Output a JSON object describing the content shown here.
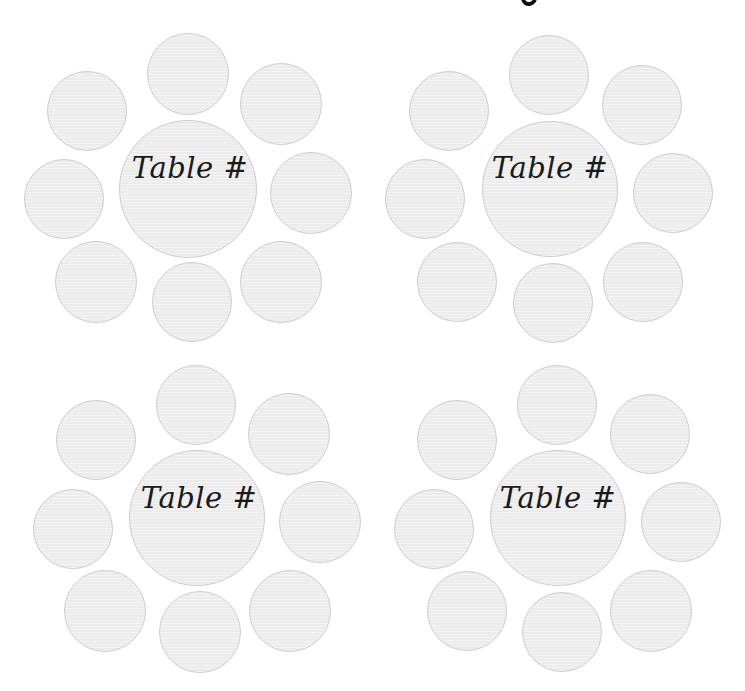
{
  "page": {
    "width": 745,
    "height": 691,
    "background": "#ffffff"
  },
  "title": {
    "visible_fragment": "g",
    "note_visible": "only the bottom tail of a descender glyph is visible at top edge"
  },
  "style": {
    "seat_fill": "#eeeeee",
    "seat_border": "#cdcdcd",
    "label_color": "#1a1a1a"
  },
  "tables": [
    {
      "label": "Table #",
      "center": {
        "x": 188,
        "y": 189,
        "r": 69
      },
      "label_pos": {
        "x": 190,
        "y": 168
      },
      "seats": [
        {
          "x": 188,
          "y": 74,
          "r": 41
        },
        {
          "x": 281,
          "y": 104,
          "r": 41
        },
        {
          "x": 311,
          "y": 193,
          "r": 41
        },
        {
          "x": 281,
          "y": 282,
          "r": 41
        },
        {
          "x": 192,
          "y": 302,
          "r": 40
        },
        {
          "x": 96,
          "y": 282,
          "r": 41
        },
        {
          "x": 64,
          "y": 199,
          "r": 40
        },
        {
          "x": 87,
          "y": 111,
          "r": 40
        }
      ]
    },
    {
      "label": "Table #",
      "center": {
        "x": 550,
        "y": 189,
        "r": 68
      },
      "label_pos": {
        "x": 550,
        "y": 168
      },
      "seats": [
        {
          "x": 549,
          "y": 75,
          "r": 40
        },
        {
          "x": 642,
          "y": 105,
          "r": 40
        },
        {
          "x": 673,
          "y": 193,
          "r": 40
        },
        {
          "x": 643,
          "y": 282,
          "r": 40
        },
        {
          "x": 553,
          "y": 303,
          "r": 40
        },
        {
          "x": 457,
          "y": 282,
          "r": 40
        },
        {
          "x": 425,
          "y": 199,
          "r": 40
        },
        {
          "x": 449,
          "y": 111,
          "r": 40
        }
      ]
    },
    {
      "label": "Table #",
      "center": {
        "x": 197,
        "y": 518,
        "r": 68
      },
      "label_pos": {
        "x": 199,
        "y": 498
      },
      "seats": [
        {
          "x": 196,
          "y": 405,
          "r": 40
        },
        {
          "x": 289,
          "y": 434,
          "r": 41
        },
        {
          "x": 320,
          "y": 522,
          "r": 41
        },
        {
          "x": 290,
          "y": 611,
          "r": 41
        },
        {
          "x": 200,
          "y": 632,
          "r": 41
        },
        {
          "x": 105,
          "y": 611,
          "r": 41
        },
        {
          "x": 73,
          "y": 529,
          "r": 40
        },
        {
          "x": 96,
          "y": 440,
          "r": 40
        }
      ]
    },
    {
      "label": "Table #",
      "center": {
        "x": 558,
        "y": 518,
        "r": 68
      },
      "label_pos": {
        "x": 558,
        "y": 498
      },
      "seats": [
        {
          "x": 557,
          "y": 405,
          "r": 40
        },
        {
          "x": 650,
          "y": 434,
          "r": 40
        },
        {
          "x": 681,
          "y": 522,
          "r": 40
        },
        {
          "x": 651,
          "y": 611,
          "r": 41
        },
        {
          "x": 562,
          "y": 632,
          "r": 40
        },
        {
          "x": 467,
          "y": 611,
          "r": 40
        },
        {
          "x": 434,
          "y": 529,
          "r": 40
        },
        {
          "x": 457,
          "y": 440,
          "r": 40
        }
      ]
    }
  ]
}
